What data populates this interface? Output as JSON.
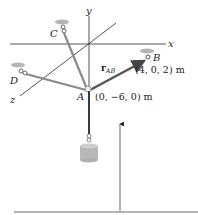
{
  "figure": {
    "axes": {
      "x_label": "x",
      "y_label": "y",
      "z_label": "z"
    },
    "points": {
      "A": {
        "label": "A",
        "coords": "(0, −6, 0) m"
      },
      "B": {
        "label": "B",
        "coords": "(4, 0, 2) m"
      },
      "C": {
        "label": "C"
      },
      "D": {
        "label": "D"
      }
    },
    "vector": {
      "bold": "r",
      "subscript": "AB"
    },
    "colors": {
      "axis": "#2a2a2a",
      "cable": "#8a8a8a",
      "vector": "#555555",
      "support_disc": "#b5b5b5",
      "weight": "#b8b8b8"
    }
  }
}
